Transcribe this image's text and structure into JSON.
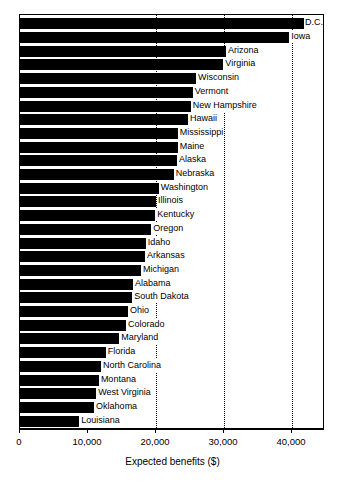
{
  "chart_data": {
    "type": "bar",
    "orientation": "horizontal",
    "title": "",
    "xlabel": "Expected benefits ($)",
    "ylabel": "",
    "xlim": [
      0,
      44800
    ],
    "xticks": [
      0,
      10000,
      20000,
      30000,
      40000
    ],
    "xtick_labels": [
      "0",
      "10,000",
      "20,000",
      "30,000",
      "40,000"
    ],
    "grid": "vertical dotted at 20,000 / 30,000 / 40,000",
    "legend": "none",
    "bar_color": "#000000",
    "categories": [
      "D.C.",
      "Iowa",
      "Arizona",
      "Virginia",
      "Wisconsin",
      "Vermont",
      "New Hampshire",
      "Hawaii",
      "Mississippi",
      "Maine",
      "Alaska",
      "Nebraska",
      "Washington",
      "Illinois",
      "Kentucky",
      "Oregon",
      "Idaho",
      "Arkansas",
      "Michigan",
      "Alabama",
      "South Dakota",
      "Ohio",
      "Colorado",
      "Maryland",
      "Florida",
      "North Carolina",
      "Montana",
      "West Virginia",
      "Oklahoma",
      "Louisiana"
    ],
    "values": [
      41800,
      39600,
      30300,
      29900,
      25900,
      25400,
      25100,
      24700,
      23200,
      23200,
      23100,
      22600,
      20400,
      20000,
      19900,
      19300,
      18500,
      18400,
      17800,
      16600,
      16500,
      15900,
      15600,
      14600,
      12600,
      11900,
      11600,
      11200,
      10900,
      8700
    ]
  }
}
